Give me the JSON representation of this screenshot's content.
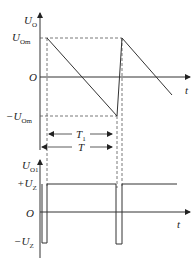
{
  "diagram": {
    "type": "waveform-diagram",
    "colors": {
      "line": "#333333",
      "dashed": "#555555",
      "background": "#ffffff"
    },
    "top_plot": {
      "y_axis_label": "U",
      "y_axis_label_sub": "O",
      "x_axis_label": "t",
      "origin_label": "O",
      "upper_level_label": "U",
      "upper_level_sub": "Om",
      "lower_level_label": "−U",
      "lower_level_sub": "Om",
      "waveform": "sawtooth",
      "interval_T1_label": "T",
      "interval_T1_sub": "1",
      "interval_T_label": "T"
    },
    "bottom_plot": {
      "y_axis_label": "U",
      "y_axis_label_sub": "O1",
      "x_axis_label": "t",
      "origin_label": "O",
      "upper_level_label": "+U",
      "upper_level_sub": "Z",
      "lower_level_label": "−U",
      "lower_level_sub": "Z",
      "waveform": "pulse"
    }
  }
}
